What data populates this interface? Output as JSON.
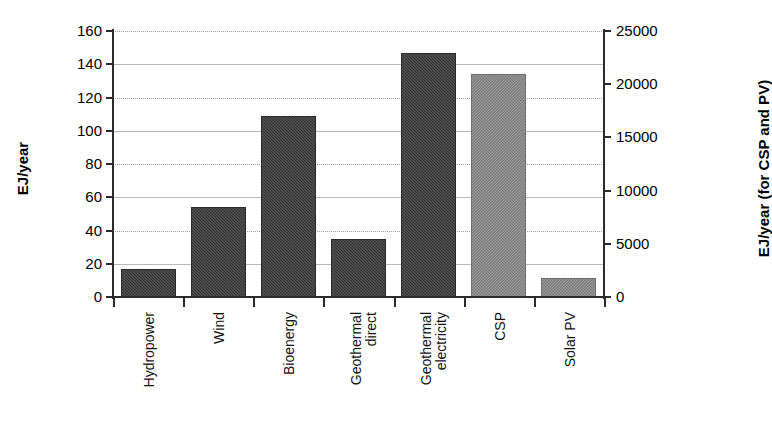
{
  "chart_data": {
    "type": "bar",
    "title": "",
    "xlabel": "",
    "ylabel": "EJ/year",
    "y2label": "EJ/year (for CSP and PV)",
    "ylim": [
      0,
      160
    ],
    "y2lim": [
      0,
      25000
    ],
    "grid": true,
    "legend": "none",
    "left_ticks": [
      "160",
      "140",
      "120",
      "100",
      "80",
      "60",
      "40",
      "20",
      "0"
    ],
    "left_tick_values": [
      160,
      140,
      120,
      100,
      80,
      60,
      40,
      20,
      0
    ],
    "right_ticks": [
      "25000",
      "20000",
      "15000",
      "10000",
      "5000",
      "0"
    ],
    "right_tick_values": [
      25000,
      20000,
      15000,
      10000,
      5000,
      0
    ],
    "categories": [
      "Hydropower",
      "Wind",
      "Bioenergy",
      "Geothermal direct",
      "Geothermal electricity",
      "CSP",
      "Solar PV"
    ],
    "category_lines": [
      [
        "Hydropower"
      ],
      [
        "Wind"
      ],
      [
        "Bioenergy"
      ],
      [
        "Geothermal",
        "direct"
      ],
      [
        "Geothermal",
        "electricity"
      ],
      [
        "CSP"
      ],
      [
        "Solar PV"
      ]
    ],
    "series": [
      {
        "name": "EJ/year (left axis)",
        "axis": "left",
        "color": "#3b3b3b",
        "values": [
          17,
          54,
          109,
          35,
          147,
          null,
          null
        ]
      },
      {
        "name": "EJ/year (right axis, CSP and PV)",
        "axis": "right",
        "color": "#8d8d8d",
        "values": [
          null,
          null,
          null,
          null,
          null,
          21000,
          1800
        ]
      }
    ],
    "bars": [
      {
        "category": "Hydropower",
        "value": 17,
        "axis": "left",
        "color": "#3b3b3b"
      },
      {
        "category": "Wind",
        "value": 54,
        "axis": "left",
        "color": "#3b3b3b"
      },
      {
        "category": "Bioenergy",
        "value": 109,
        "axis": "left",
        "color": "#3b3b3b"
      },
      {
        "category": "Geothermal direct",
        "value": 35,
        "axis": "left",
        "color": "#3b3b3b"
      },
      {
        "category": "Geothermal electricity",
        "value": 147,
        "axis": "left",
        "color": "#3b3b3b"
      },
      {
        "category": "CSP",
        "value": 21000,
        "axis": "right",
        "color": "#8d8d8d"
      },
      {
        "category": "Solar PV",
        "value": 1800,
        "axis": "right",
        "color": "#8d8d8d"
      }
    ]
  },
  "colors": {
    "bar_dark": "#3b3b3b",
    "bar_light": "#8d8d8d",
    "axis": "#2b2b2b",
    "gridline": "#b8b8b8",
    "background": "#ffffff"
  }
}
